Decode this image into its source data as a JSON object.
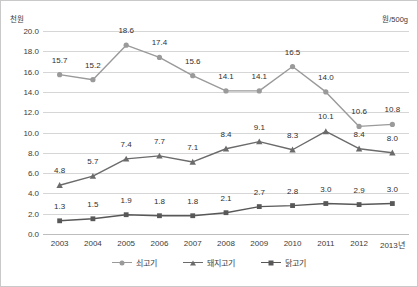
{
  "units": {
    "left": "천원",
    "right": "원/500g"
  },
  "chart_data": {
    "type": "line",
    "title": "",
    "subtitle": "",
    "xlabel": "",
    "ylabel": "천원",
    "unit_note": "원/500g",
    "ylim": [
      0.0,
      20.0
    ],
    "ytick_step": 2.0,
    "ytick_labels": [
      "0.0",
      "2.0",
      "4.0",
      "6.0",
      "8.0",
      "10.0",
      "12.0",
      "14.0",
      "16.0",
      "18.0",
      "20.0"
    ],
    "grid": true,
    "legend_position": "bottom-center",
    "categories": [
      "2003",
      "2004",
      "2005",
      "2006",
      "2007",
      "2008",
      "2009",
      "2010",
      "2011",
      "2012",
      "2013년"
    ],
    "series": [
      {
        "name": "쇠고기",
        "color": "#9a9a9a",
        "marker": "circle",
        "values": [
          15.7,
          15.2,
          18.6,
          17.4,
          15.6,
          14.1,
          14.1,
          16.5,
          14.0,
          10.6,
          10.8
        ],
        "labels": [
          "15.7",
          "15.2",
          "18.6",
          "17.4",
          "15.6",
          "14.1",
          "14.1",
          "16.5",
          "14.0",
          "10.6",
          "10.8"
        ]
      },
      {
        "name": "돼지고기",
        "color": "#6b6b6b",
        "marker": "triangle",
        "values": [
          4.8,
          5.7,
          7.4,
          7.7,
          7.1,
          8.4,
          9.1,
          8.3,
          10.1,
          8.4,
          8.0
        ],
        "labels": [
          "4.8",
          "5.7",
          "7.4",
          "7.7",
          "7.1",
          "8.4",
          "9.1",
          "8.3",
          "10.1",
          "8.4",
          "8.0"
        ]
      },
      {
        "name": "닭고기",
        "color": "#585858",
        "marker": "square",
        "values": [
          1.3,
          1.5,
          1.9,
          1.8,
          1.8,
          2.1,
          2.7,
          2.8,
          3.0,
          2.9,
          3.0
        ],
        "labels": [
          "1.3",
          "1.5",
          "1.9",
          "1.8",
          "1.8",
          "2.1",
          "2.7",
          "2.8",
          "3.0",
          "2.9",
          "3.0"
        ]
      }
    ],
    "label_offsets": {
      "쇠고기": [
        -10,
        -10,
        -10,
        -10,
        -10,
        -10,
        -10,
        -10,
        -10,
        -10,
        -10
      ],
      "돼지고기": [
        -10,
        -10,
        -10,
        -10,
        -10,
        -10,
        -10,
        -10,
        -10,
        -10,
        -10
      ],
      "닭고기": [
        -10,
        -10,
        -10,
        -10,
        -10,
        -10,
        -10,
        -10,
        -10,
        -10,
        -10
      ]
    }
  }
}
